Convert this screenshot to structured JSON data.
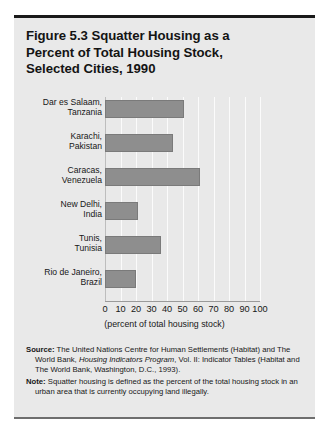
{
  "figure": {
    "title": "Figure 5.3  Squatter Housing as a Percent of Total Housing Stock, Selected Cities, 1990",
    "title_lines": [
      "Figure 5.3  Squatter Housing as a",
      "Percent of Total Housing Stock,",
      "Selected Cities, 1990"
    ]
  },
  "chart_data": {
    "type": "bar",
    "orientation": "horizontal",
    "title": "Figure 5.3  Squatter Housing as a Percent of Total Housing Stock, Selected Cities, 1990",
    "xlabel": "(percent of total housing stock)",
    "ylabel": "",
    "xlim": [
      0,
      100
    ],
    "xticks": [
      0,
      10,
      20,
      30,
      40,
      50,
      60,
      70,
      80,
      90,
      100
    ],
    "xtick_labels": [
      "0",
      "10",
      "20",
      "30",
      "40",
      "50",
      "60",
      "70",
      "80",
      "90",
      "100"
    ],
    "grid": true,
    "legend": null,
    "bar_color": "#8e8e8e",
    "background_color": "#e9e9e9",
    "categories": [
      "Dar es Salaam, Tanzania",
      "Karachi, Pakistan",
      "Caracas, Venezuela",
      "New Delhi, India",
      "Tunis, Tunisia",
      "Rio de Janeiro, Brazil"
    ],
    "category_lines": [
      [
        "Dar es Salaam,",
        "Tanzania"
      ],
      [
        "Karachi,",
        "Pakistan"
      ],
      [
        "Caracas,",
        "Venezuela"
      ],
      [
        "New Delhi,",
        "India"
      ],
      [
        "Tunis,",
        "Tunisia"
      ],
      [
        "Rio de Janeiro,",
        "Brazil"
      ]
    ],
    "values": [
      51,
      44,
      61,
      21,
      36,
      20
    ]
  },
  "notes": {
    "source_label": "Source:",
    "source_part1": " The United Nations Centre for Human Settlements (Habitat) and The World Bank, ",
    "source_italic": "Housing Indicators Program",
    "source_part2": ", Vol. II: Indicator Tables (Habitat and The World Bank, Washington, D.C., 1993).",
    "note_label": "Note:",
    "note_text": " Squatter housing is defined as the percent of the total housing stock in an urban area that is currently occupying land illegally."
  }
}
